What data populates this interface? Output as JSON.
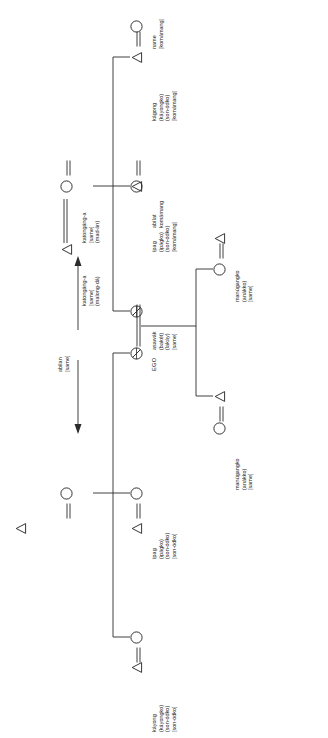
{
  "diagram": {
    "type": "kinship-chart",
    "orientation": "rotated-ccw",
    "line_color": "#2b2b2b",
    "text_color": "#1b1b1b",
    "background": "#ffffff",
    "symbols": {
      "female": "circle",
      "male": "triangle",
      "ego": "circle-with-cross",
      "marriage": "double-line",
      "descent": "bracket-line"
    },
    "legend_note": "abilan / katongáng-a axis arrows mark ascending and descending generations"
  },
  "axis": {
    "up_label": {
      "lines": [
        "abilan",
        "[same]"
      ]
    },
    "down_label": {
      "lines": [
        "katongáng-a",
        "[same]",
        "(malong-dá)"
      ]
    },
    "spouse_label": {
      "lines": [
        "katongáng-a",
        "[same]",
        "(mad-án)"
      ]
    }
  },
  "nodes": [
    {
      "id": "n-name-f",
      "symbol": "circle",
      "lines": [
        "name",
        "[komámang]"
      ]
    },
    {
      "id": "n-kagong-top",
      "symbol": "triangle",
      "lines": [
        "kágong",
        "(káyongko)",
        "(son-ódko)",
        "[komámang]"
      ]
    },
    {
      "id": "n-abilat",
      "symbol": "triangle",
      "lines": [
        "abílat",
        "komámang"
      ]
    },
    {
      "id": "n-ipag-top",
      "symbol": "circle",
      "lines": [
        "ípag",
        "(ipágko)",
        "(son-ódko)",
        "[komámang]"
      ]
    },
    {
      "id": "n-asawak",
      "symbol": "ego",
      "lines": [
        "asawák",
        "(bakét)",
        "(lakáy)",
        "[same]"
      ]
    },
    {
      "id": "n-ego",
      "symbol": "ego",
      "lines": [
        "EGO"
      ]
    },
    {
      "id": "n-ipag-low",
      "symbol": "circle",
      "lines": [
        "ípag",
        "(ipágko)",
        "(son-ódko)",
        "[son-ódko]"
      ]
    },
    {
      "id": "n-male-low",
      "symbol": "triangle",
      "lines": []
    },
    {
      "id": "n-circle-low",
      "symbol": "circle",
      "lines": []
    },
    {
      "id": "n-kagong-bottom",
      "symbol": "triangle",
      "lines": [
        "káyong",
        "(káyongko)",
        "(son-ódko)",
        "[son-ódko]"
      ]
    },
    {
      "id": "n-manugang-up-f",
      "symbol": "circle",
      "lines": []
    },
    {
      "id": "n-manugang-up-m",
      "symbol": "triangle",
      "lines": [
        "manúgangko",
        "(anákko)",
        "[same]"
      ]
    },
    {
      "id": "n-manugang-dn-f",
      "symbol": "circle",
      "lines": [
        "manúgangko",
        "(anákko)",
        "[same]"
      ]
    },
    {
      "id": "n-manugang-dn-m",
      "symbol": "triangle",
      "lines": []
    },
    {
      "id": "n-top-left-f",
      "symbol": "circle",
      "lines": []
    },
    {
      "id": "n-top-left-m",
      "symbol": "triangle",
      "lines": []
    }
  ]
}
